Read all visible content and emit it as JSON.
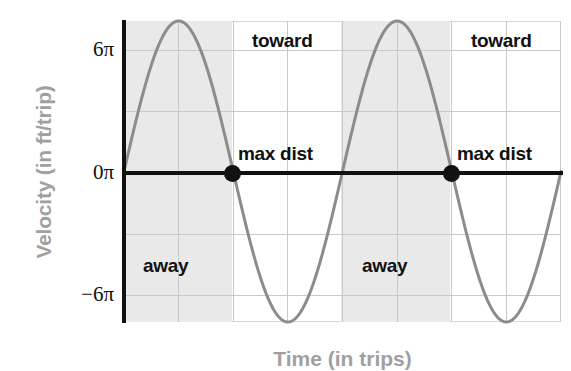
{
  "chart_data": {
    "type": "line",
    "title": "",
    "subtitle": "",
    "xlabel": "Time (in trips)",
    "ylabel": "Velocity (in ft/trip)",
    "ylim": [
      -7.3,
      7.3
    ],
    "xlim": [
      0,
      8
    ],
    "grid": true,
    "legend_position": "none",
    "y_ticks": [
      {
        "value": 6,
        "label": "6π"
      },
      {
        "value": 0,
        "label": "0π"
      },
      {
        "value": -6,
        "label": "−6π"
      }
    ],
    "y_gridlines": [
      6,
      3,
      0,
      -3,
      -6
    ],
    "x_gridlines": [
      0,
      1,
      2,
      3,
      4,
      5,
      6,
      7,
      8
    ],
    "series": [
      {
        "name": "velocity",
        "color": "#8c8c8c",
        "function": "amplitude * sin(2*pi*x / period)",
        "amplitude": 7.3,
        "period": 4,
        "phase": 0,
        "points": [
          {
            "x": 0,
            "y": 0
          },
          {
            "x": 1,
            "y": 7.3
          },
          {
            "x": 2,
            "y": 0
          },
          {
            "x": 3,
            "y": -7.3
          },
          {
            "x": 4,
            "y": 0
          },
          {
            "x": 5,
            "y": 7.3
          },
          {
            "x": 6,
            "y": 0
          },
          {
            "x": 7,
            "y": -7.3
          },
          {
            "x": 8,
            "y": 0
          }
        ]
      }
    ],
    "markers": [
      {
        "label": "max dist",
        "x": 2,
        "y": 0
      },
      {
        "label": "max dist",
        "x": 6,
        "y": 0
      }
    ],
    "shaded_regions": [
      {
        "label": "away",
        "x_start": 0,
        "x_end": 2,
        "color": "#e9e9e9"
      },
      {
        "label": "away",
        "x_start": 4,
        "x_end": 6,
        "color": "#e9e9e9"
      }
    ],
    "annotations": [
      {
        "text": "toward",
        "x": 3.0,
        "y": 6.6
      },
      {
        "text": "toward",
        "x": 7.0,
        "y": 6.6
      },
      {
        "text": "max dist",
        "x": 2.1,
        "y": 0.9
      },
      {
        "text": "max dist",
        "x": 6.1,
        "y": 0.9
      },
      {
        "text": "away",
        "x": 0.9,
        "y": -4.5
      },
      {
        "text": "away",
        "x": 4.9,
        "y": -4.5
      }
    ]
  },
  "axes": {
    "y_title": "Velocity (in ft/trip)",
    "x_title": "Time (in trips)",
    "y_tick_labels": [
      "6π",
      "0π",
      "−6π"
    ]
  },
  "labels": {
    "toward_1": "toward",
    "toward_2": "toward",
    "max_dist_1": "max dist",
    "max_dist_2": "max dist",
    "away_1": "away",
    "away_2": "away"
  },
  "colors": {
    "curve": "#8c8c8c",
    "axis": "#111111",
    "grid": "#c9c9c9",
    "shade": "#e9e9e9",
    "axis_title": "#a0a0a0",
    "background": "#ffffff"
  }
}
